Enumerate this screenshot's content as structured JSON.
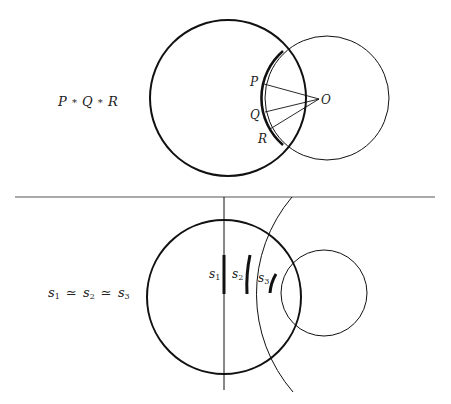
{
  "top_panel": {
    "caption": "P * Q * R",
    "caption_parts": [
      "P",
      "*",
      "Q",
      "*",
      "R"
    ],
    "points": [
      {
        "label": "P"
      },
      {
        "label": "Q"
      },
      {
        "label": "R"
      },
      {
        "label": "O"
      }
    ]
  },
  "bottom_panel": {
    "caption_parts": [
      "s",
      "1",
      "≃",
      "s",
      "2",
      "≃",
      "s",
      "3"
    ],
    "segments": [
      {
        "base": "s",
        "sub": "1"
      },
      {
        "base": "s",
        "sub": "2"
      },
      {
        "base": "s",
        "sub": "3"
      }
    ]
  },
  "colors": {
    "stroke": "#111111",
    "divider": "#555555"
  }
}
